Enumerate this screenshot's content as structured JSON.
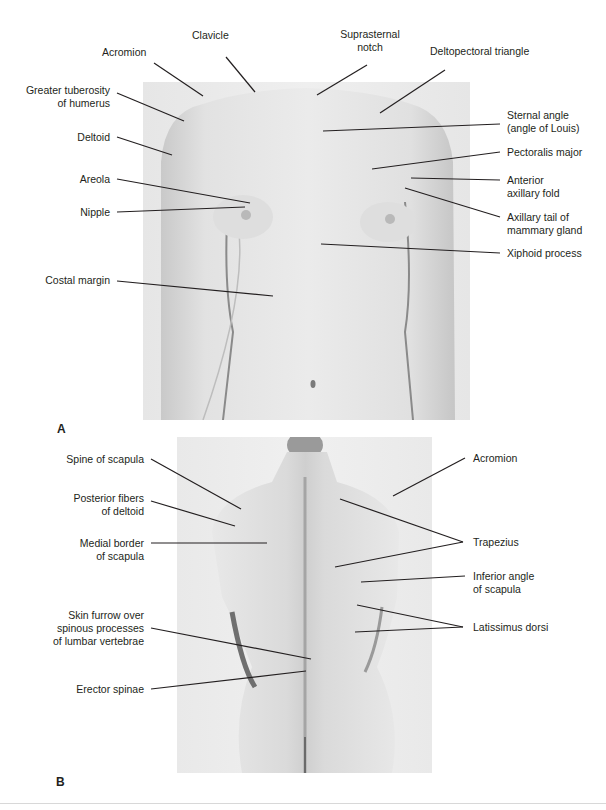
{
  "figure": {
    "panel_a": {
      "letter": "A",
      "view": "anterior",
      "labels": {
        "acromion": "Acromion",
        "clavicle": "Clavicle",
        "suprasternal_notch_1": "Suprasternal",
        "suprasternal_notch_2": "notch",
        "deltopectoral_triangle": "Deltopectoral triangle",
        "greater_tuberosity_1": "Greater tuberosity",
        "greater_tuberosity_2": "of humerus",
        "deltoid": "Deltoid",
        "areola": "Areola",
        "nipple": "Nipple",
        "costal_margin": "Costal margin",
        "sternal_angle_1": "Sternal angle",
        "sternal_angle_2": "(angle of Louis)",
        "pectoralis_major": "Pectoralis major",
        "anterior_axillary_fold_1": "Anterior",
        "anterior_axillary_fold_2": "axillary fold",
        "axillary_tail_1": "Axillary tail of",
        "axillary_tail_2": "mammary gland",
        "xiphoid_process": "Xiphoid process"
      }
    },
    "panel_b": {
      "letter": "B",
      "view": "posterior",
      "labels": {
        "spine_of_scapula": "Spine of scapula",
        "posterior_deltoid_1": "Posterior fibers",
        "posterior_deltoid_2": "of deltoid",
        "medial_border_1": "Medial border",
        "medial_border_2": "of scapula",
        "skin_furrow_1": "Skin furrow over",
        "skin_furrow_2": "spinous processes",
        "skin_furrow_3": "of lumbar vertebrae",
        "erector_spinae": "Erector spinae",
        "acromion": "Acromion",
        "trapezius": "Trapezius",
        "inferior_angle_1": "Inferior angle",
        "inferior_angle_2": "of scapula",
        "latissimus_dorsi": "Latissimus dorsi"
      }
    }
  }
}
